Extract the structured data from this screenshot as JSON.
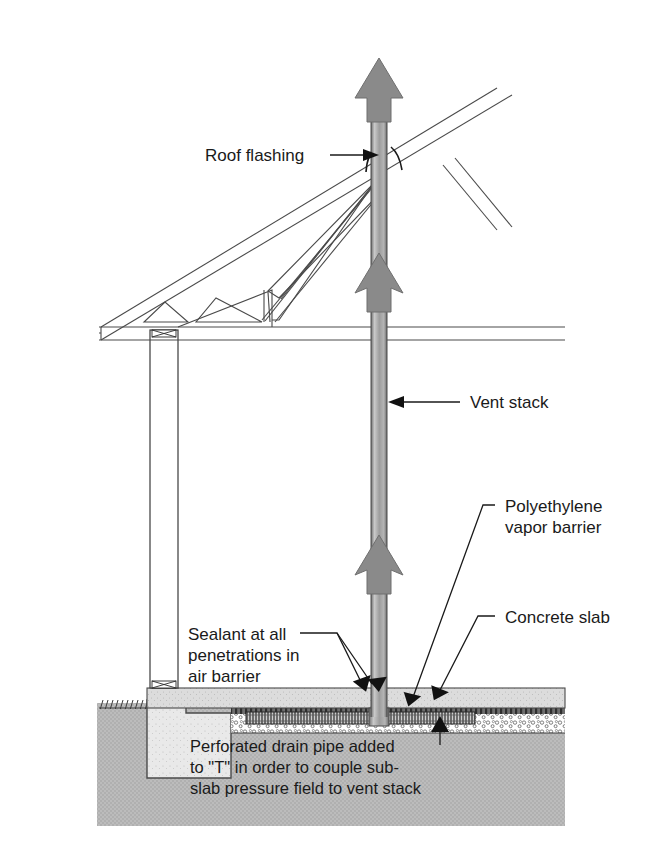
{
  "diagram": {
    "type": "architectural-section",
    "background_color": "#ffffff",
    "colors": {
      "soil_fill": "#b9b9b9",
      "concrete_slab": "#d8d8d8",
      "aggregate": "#ffffff",
      "footing": "#e6e6e6",
      "pipe_gray": "#9a9a9a",
      "arrow_gray": "#8a8a8a",
      "line": "#3a3a3a",
      "text": "#1a1a1a"
    },
    "labels": [
      {
        "id": "roof-flashing",
        "text": "Roof flashing",
        "x": 205,
        "y": 160,
        "lines": [
          "Roof flashing"
        ]
      },
      {
        "id": "vent-stack",
        "text": "Vent stack",
        "x": 470,
        "y": 405,
        "lines": [
          "Vent stack"
        ]
      },
      {
        "id": "poly-barrier",
        "text": "Polyethylene vapor barrier",
        "x": 505,
        "y": 512,
        "lines": [
          "Polyethylene",
          "vapor barrier"
        ]
      },
      {
        "id": "concrete-slab",
        "text": "Concrete slab",
        "x": 505,
        "y": 622,
        "lines": [
          "Concrete slab"
        ]
      },
      {
        "id": "sealant",
        "text": "Sealant at all penetrations in air barrier",
        "x": 188,
        "y": 640,
        "lines": [
          "Sealant at all",
          "penetrations in",
          "air barrier"
        ]
      },
      {
        "id": "drain-pipe",
        "text": "Perforated drain pipe added to \"T\" in order to couple sub-slab pressure field to vent stack",
        "x": 190,
        "y": 752,
        "lines": [
          "Perforated drain pipe added",
          "to \"T\" in order to couple sub-",
          "slab pressure field to vent stack"
        ]
      }
    ],
    "components": [
      {
        "name": "vent-stack-pipe",
        "description": "vertical gray pipe from roof peak to beneath slab"
      },
      {
        "name": "airflow-arrow-top",
        "description": "gray upward arrow at stack top"
      },
      {
        "name": "airflow-arrow-middle",
        "description": "gray upward arrow at attic level"
      },
      {
        "name": "airflow-arrow-lower",
        "description": "gray upward arrow above slab"
      },
      {
        "name": "roof-truss",
        "description": "sloped roof truss with web members"
      },
      {
        "name": "ceiling-chord",
        "description": "horizontal bottom chord of truss"
      },
      {
        "name": "exterior-wall",
        "description": "vertical wall section at left"
      },
      {
        "name": "concrete-slab-layer",
        "description": "horizontal concrete slab"
      },
      {
        "name": "polyethylene-layer",
        "description": "vapor barrier beneath slab"
      },
      {
        "name": "aggregate-layer",
        "description": "crushed stone sub-base"
      },
      {
        "name": "perforated-drain-pipe",
        "description": "horizontal perforated pipe under slab"
      },
      {
        "name": "footing",
        "description": "concrete footing at wall base"
      },
      {
        "name": "soil",
        "description": "gray soil fill below grade"
      },
      {
        "name": "grade-line",
        "description": "hatched grade line at left"
      },
      {
        "name": "roof-flashing-boot",
        "description": "flashing curve where stack exits roof"
      }
    ]
  }
}
